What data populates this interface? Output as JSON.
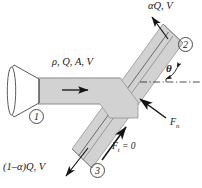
{
  "figure": {
    "background_color": "#ffffff",
    "pipe_fill_color": "#d2d2d2",
    "pipe_edge_color": "#7a7a7a",
    "line_color": "#1a1a1a",
    "arrow_color": "#141414"
  },
  "labels": {
    "inlet_properties": "ρ, Q, A, V",
    "outlet_upper": "αQ, V",
    "outlet_lower": "(1–α)Q, V",
    "angle": "θ",
    "force_normal": "F",
    "force_normal_sub": "n",
    "force_tangential": "F",
    "force_tangential_sub": "t",
    "force_tangential_value": "= 0"
  },
  "stations": [
    {
      "id": "1",
      "label": "1",
      "description": "inlet nozzle station"
    },
    {
      "id": "2",
      "label": "2",
      "description": "upper diagonal outlet station"
    },
    {
      "id": "3",
      "label": "3",
      "description": "lower diagonal outlet station"
    }
  ],
  "icons": {
    "nozzle": "bell-mouth-nozzle-icon",
    "flow_arrow_inlet": "flow-arrow-right-icon",
    "flow_arrow_upper": "flow-arrow-up-right-icon",
    "flow_arrow_lower": "flow-arrow-down-left-icon",
    "force_normal_arrow": "force-arrow-up-left-icon",
    "force_tangential_arrow": "force-arrow-up-right-icon",
    "centerline": "dash-dot-centerline-icon",
    "angle_arc": "angle-arc-icon"
  }
}
